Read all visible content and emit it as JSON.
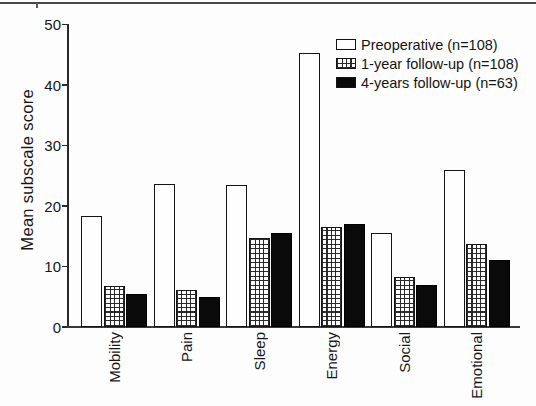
{
  "chart_data": {
    "type": "bar",
    "title": "",
    "xlabel": "",
    "ylabel": "Mean subscale score",
    "ylim": [
      0,
      50
    ],
    "yticks": [
      0,
      10,
      20,
      30,
      40,
      50
    ],
    "grid": false,
    "legend_position": "top-right",
    "categories": [
      "Mobility",
      "Pain",
      "Sleep",
      "Energy",
      "Social",
      "Emotional"
    ],
    "series": [
      {
        "name": "Preoperative (n=108)",
        "key": "preoperative",
        "fill": "white-outline",
        "values": [
          18.4,
          23.6,
          23.5,
          45.3,
          15.6,
          26.0
        ]
      },
      {
        "name": "1-year follow-up (n=108)",
        "key": "1-year-follow-up",
        "fill": "grid-hatch",
        "values": [
          6.7,
          6.1,
          14.7,
          16.6,
          8.2,
          13.8
        ]
      },
      {
        "name": "4-years follow-up (n=63)",
        "key": "4-years-follow-up",
        "fill": "solid-black",
        "values": [
          5.4,
          5.0,
          15.5,
          17.1,
          6.9,
          11.1
        ]
      }
    ],
    "colors": {
      "ink": "#1c1c1c",
      "bar_outline": "#141414",
      "bar_black": "#0a0a0a",
      "background": "#ffffff",
      "page_rule": "#484848"
    }
  }
}
